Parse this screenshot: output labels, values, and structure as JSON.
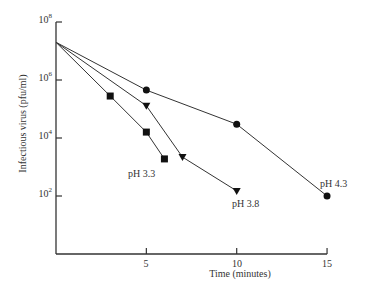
{
  "chart_data": {
    "type": "line",
    "title": "",
    "xlabel": "Time (minutes)",
    "ylabel": "Infectious virus (pfu/ml)",
    "yscale": "log",
    "xlim": [
      0,
      15
    ],
    "ylim": [
      1,
      100000000
    ],
    "x_ticks": [
      5,
      10,
      15
    ],
    "x_tick_labels": [
      "5",
      "10",
      "15"
    ],
    "y_ticks": [
      100,
      10000,
      1000000,
      100000000
    ],
    "y_tick_labels": [
      {
        "base": "10",
        "exp": "2"
      },
      {
        "base": "10",
        "exp": "4"
      },
      {
        "base": "10",
        "exp": "6"
      },
      {
        "base": "10",
        "exp": "8"
      }
    ],
    "grid": false,
    "legend": "none (series labeled inline)",
    "series": [
      {
        "name": "pH 3.3",
        "marker": "square",
        "x": [
          0,
          3,
          5,
          6
        ],
        "y": [
          20000000,
          280000,
          16000,
          1900
        ]
      },
      {
        "name": "pH 3.8",
        "marker": "triangle-down",
        "x": [
          0,
          5,
          7,
          10
        ],
        "y": [
          20000000,
          130000,
          2200,
          150
        ]
      },
      {
        "name": "pH 4.3",
        "marker": "circle",
        "x": [
          0,
          5,
          10,
          15
        ],
        "y": [
          20000000,
          450000,
          30000,
          100
        ]
      }
    ],
    "annotations": [
      {
        "text": "pH 3.3",
        "near_series": "pH 3.3"
      },
      {
        "text": "pH 3.8",
        "near_series": "pH 3.8"
      },
      {
        "text": "pH 4.3",
        "near_series": "pH 4.3"
      }
    ]
  },
  "layout": {
    "plot_left": 56,
    "plot_bottom": 254,
    "px_per_minute": 18.07,
    "y_top_px": 22,
    "px_per_decade": 29,
    "line_color": "#333333",
    "marker_color": "#111111"
  }
}
